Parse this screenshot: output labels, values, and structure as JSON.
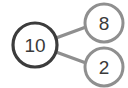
{
  "diagram": {
    "type": "number-bond",
    "background_color": "#ffffff",
    "whole": {
      "name": "whole-node",
      "value": "10",
      "cx": 35,
      "cy": 45,
      "r": 22,
      "stroke_color": "#3c3c3c",
      "stroke_width": 3.2,
      "fill": "#ffffff",
      "text_color": "#3a3a3a"
    },
    "parts": [
      {
        "name": "part-node-top",
        "value": "8",
        "cx": 104,
        "cy": 23,
        "r": 19,
        "stroke_color": "#8f8f8f",
        "stroke_width": 3.0,
        "fill": "#ffffff",
        "text_color": "#3a3a3a"
      },
      {
        "name": "part-node-bottom",
        "value": "2",
        "cx": 104,
        "cy": 67,
        "r": 19,
        "stroke_color": "#8f8f8f",
        "stroke_width": 3.0,
        "fill": "#ffffff",
        "text_color": "#3a3a3a"
      }
    ],
    "connectors": [
      {
        "name": "connector-whole-to-top",
        "x1": 56,
        "y1": 38,
        "x2": 86,
        "y2": 27,
        "stroke_color": "#8f8f8f",
        "stroke_width": 3.4
      },
      {
        "name": "connector-whole-to-bottom",
        "x1": 56,
        "y1": 52,
        "x2": 86,
        "y2": 63,
        "stroke_color": "#8f8f8f",
        "stroke_width": 3.4
      }
    ]
  }
}
